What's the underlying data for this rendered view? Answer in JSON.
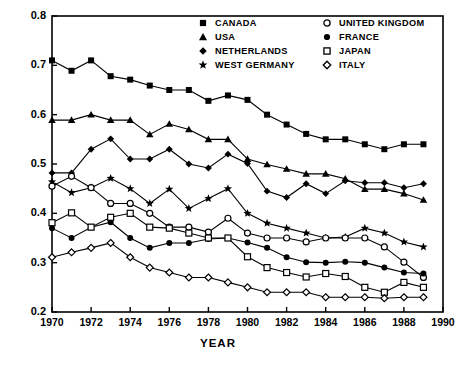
{
  "chart_data": {
    "type": "line",
    "title": "",
    "xlabel": "YEAR",
    "ylabel": "",
    "xlim": [
      1970,
      1990
    ],
    "ylim": [
      0.2,
      0.8
    ],
    "xticks": [
      1970,
      1972,
      1974,
      1976,
      1978,
      1980,
      1982,
      1984,
      1986,
      1988,
      1990
    ],
    "yticks": [
      0.2,
      0.3,
      0.4,
      0.5,
      0.6,
      0.7,
      0.8
    ],
    "xtick_labels": [
      "1970",
      "1972",
      "1974",
      "1976",
      "1978",
      "1980",
      "1982",
      "1984",
      "1986",
      "1988",
      "1990"
    ],
    "ytick_labels": [
      "0.2",
      "0.3",
      "0.4",
      "0.5",
      "0.6",
      "0.7",
      "0.8"
    ],
    "grid": false,
    "legend_position": "top-center",
    "x": [
      1970,
      1971,
      1972,
      1973,
      1974,
      1975,
      1976,
      1977,
      1978,
      1979,
      1980,
      1981,
      1982,
      1983,
      1984,
      1985,
      1986,
      1987,
      1988,
      1989
    ],
    "series": [
      {
        "name": "CANADA",
        "marker": "filled-square",
        "color": "#000000",
        "values": [
          0.71,
          0.689,
          0.71,
          0.678,
          0.671,
          0.659,
          0.65,
          0.65,
          0.628,
          0.639,
          0.63,
          0.6,
          0.58,
          0.561,
          0.55,
          0.55,
          0.54,
          0.53,
          0.54,
          0.54
        ]
      },
      {
        "name": "USA",
        "marker": "filled-triangle",
        "color": "#000000",
        "values": [
          0.589,
          0.589,
          0.6,
          0.589,
          0.589,
          0.56,
          0.581,
          0.57,
          0.55,
          0.55,
          0.51,
          0.499,
          0.49,
          0.48,
          0.48,
          0.47,
          0.449,
          0.449,
          0.44,
          0.427
        ]
      },
      {
        "name": "NETHERLANDS",
        "marker": "filled-diamond",
        "color": "#000000",
        "values": [
          0.482,
          0.482,
          0.53,
          0.551,
          0.51,
          0.51,
          0.53,
          0.5,
          0.492,
          0.52,
          0.501,
          0.445,
          0.432,
          0.46,
          0.44,
          0.466,
          0.462,
          0.462,
          0.452,
          0.46
        ]
      },
      {
        "name": "WEST GERMANY",
        "marker": "filled-star",
        "color": "#000000",
        "values": [
          0.464,
          0.442,
          0.452,
          0.471,
          0.45,
          0.42,
          0.449,
          0.41,
          0.43,
          0.45,
          0.4,
          0.38,
          0.37,
          0.36,
          0.35,
          0.352,
          0.37,
          0.36,
          0.342,
          0.332
        ]
      },
      {
        "name": "UNITED KINGDOM",
        "marker": "open-circle",
        "color": "#000000",
        "values": [
          0.455,
          0.475,
          0.452,
          0.42,
          0.42,
          0.4,
          0.372,
          0.372,
          0.362,
          0.39,
          0.36,
          0.35,
          0.35,
          0.342,
          0.35,
          0.35,
          0.35,
          0.332,
          0.301,
          0.27
        ]
      },
      {
        "name": "FRANCE",
        "marker": "filled-circle",
        "color": "#000000",
        "values": [
          0.37,
          0.35,
          0.372,
          0.382,
          0.35,
          0.33,
          0.34,
          0.34,
          0.348,
          0.35,
          0.341,
          0.33,
          0.311,
          0.301,
          0.3,
          0.302,
          0.3,
          0.29,
          0.28,
          0.278
        ]
      },
      {
        "name": "JAPAN",
        "marker": "open-square",
        "color": "#000000",
        "values": [
          0.381,
          0.401,
          0.372,
          0.392,
          0.4,
          0.372,
          0.37,
          0.36,
          0.35,
          0.35,
          0.312,
          0.29,
          0.28,
          0.271,
          0.278,
          0.272,
          0.25,
          0.24,
          0.26,
          0.25
        ]
      },
      {
        "name": "ITALY",
        "marker": "open-diamond",
        "color": "#000000",
        "values": [
          0.311,
          0.321,
          0.33,
          0.34,
          0.311,
          0.29,
          0.28,
          0.27,
          0.27,
          0.26,
          0.25,
          0.24,
          0.24,
          0.24,
          0.23,
          0.23,
          0.23,
          0.228,
          0.23,
          0.23
        ]
      }
    ]
  },
  "axes": {
    "xtitle": "YEAR"
  },
  "legend": {
    "left_column": [
      {
        "label": "CANADA",
        "marker": "filled-square"
      },
      {
        "label": "USA",
        "marker": "filled-triangle"
      },
      {
        "label": "NETHERLANDS",
        "marker": "filled-diamond"
      },
      {
        "label": "WEST GERMANY",
        "marker": "filled-star"
      }
    ],
    "right_column": [
      {
        "label": "UNITED KINGDOM",
        "marker": "open-circle"
      },
      {
        "label": "FRANCE",
        "marker": "filled-circle"
      },
      {
        "label": "JAPAN",
        "marker": "open-square"
      },
      {
        "label": "ITALY",
        "marker": "open-diamond"
      }
    ]
  }
}
